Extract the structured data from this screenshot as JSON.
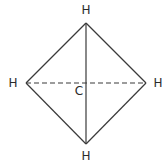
{
  "diagram": {
    "type": "molecular-structure",
    "atoms": {
      "center": {
        "label": "C",
        "x": 79,
        "y": 95
      },
      "top": {
        "label": "H",
        "x": 86,
        "y": 14
      },
      "left": {
        "label": "H",
        "x": 13,
        "y": 87
      },
      "right": {
        "label": "H",
        "x": 158,
        "y": 87
      },
      "bottom": {
        "label": "H",
        "x": 86,
        "y": 160
      }
    },
    "vertices": {
      "top": {
        "x": 86,
        "y": 23
      },
      "left": {
        "x": 26,
        "y": 83
      },
      "right": {
        "x": 146,
        "y": 83
      },
      "bottom": {
        "x": 86,
        "y": 144
      }
    },
    "colors": {
      "line": "#3a3a3a",
      "text": "#2a2a2a",
      "background": "#ffffff"
    }
  }
}
